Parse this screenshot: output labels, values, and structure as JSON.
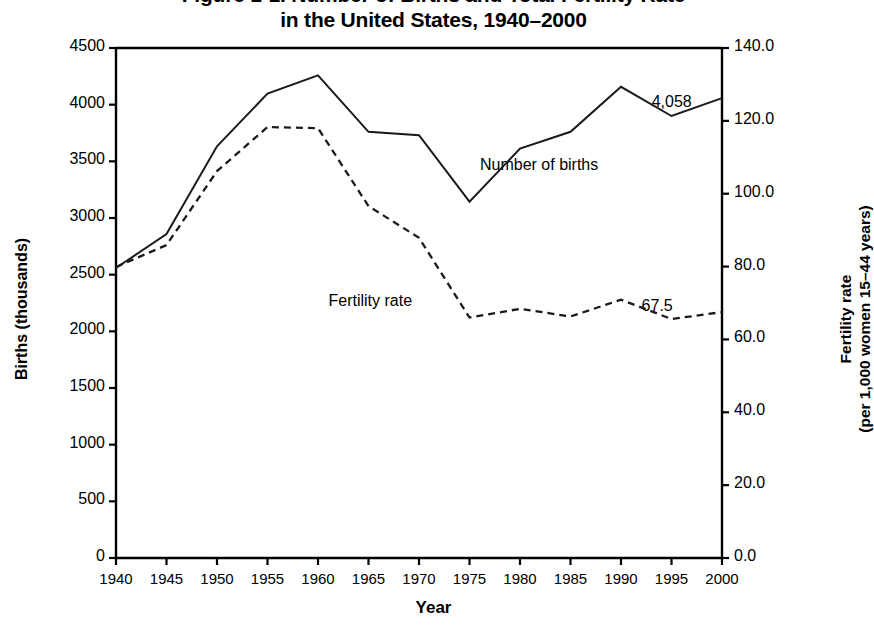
{
  "chart_data": {
    "type": "line",
    "title": "Figure 1-1. Number of Births and Total Fertility Rate in the United States, 1940–2000",
    "title_lines": [
      "Figure 1-1. Number of Births and Total Fertility Rate",
      "in the United States, 1940–2000"
    ],
    "xlabel": "Year",
    "ylabel": "Births (thousands)",
    "ylabel_right_lines": [
      "Fertility rate",
      "(per 1,000 women 15–44 years)"
    ],
    "ylabel_right": "Fertility rate (per 1,000 women 15–44 years)",
    "x": [
      1940,
      1945,
      1950,
      1955,
      1960,
      1965,
      1970,
      1975,
      1980,
      1985,
      1990,
      1995,
      2000
    ],
    "xtick_labels": [
      "1940",
      "1945",
      "1950",
      "1955",
      "1960",
      "1965",
      "1970",
      "1975",
      "1980",
      "1985",
      "1990",
      "1995",
      "2000"
    ],
    "xlim": [
      1940,
      2000
    ],
    "ylim": [
      0,
      4500
    ],
    "ytick_labels": [
      "0",
      "500",
      "1000",
      "1500",
      "2000",
      "2500",
      "3000",
      "3500",
      "4000",
      "4500"
    ],
    "yticks": [
      0,
      500,
      1000,
      1500,
      2000,
      2500,
      3000,
      3500,
      4000,
      4500
    ],
    "ylim_right": [
      0,
      140
    ],
    "ytick_labels_right": [
      "0.0",
      "20.0",
      "40.0",
      "60.0",
      "80.0",
      "100.0",
      "120.0",
      "140.0"
    ],
    "yticks_right": [
      0,
      20,
      40,
      60,
      80,
      100,
      120,
      140
    ],
    "grid": false,
    "legend_position": "inline-annotations",
    "series": [
      {
        "name": "Number of births",
        "axis": "left",
        "style": "solid",
        "color": "#1a1a1a",
        "values": [
          2559,
          2858,
          3632,
          4097,
          4258,
          3760,
          3731,
          3144,
          3612,
          3761,
          4158,
          3900,
          4058
        ]
      },
      {
        "name": "Fertility rate",
        "axis": "right",
        "style": "dashed",
        "color": "#1a1a1a",
        "values": [
          79.9,
          85.9,
          106.2,
          118.3,
          118.0,
          96.6,
          87.9,
          66.0,
          68.4,
          66.3,
          70.9,
          65.6,
          67.5
        ]
      }
    ],
    "annotations": [
      {
        "text": "Number of births",
        "x": 1980,
        "y": 3450,
        "name": "births-series-label"
      },
      {
        "text": "Fertility rate",
        "x": 1965,
        "y": 2250,
        "name": "fertility-series-label"
      },
      {
        "text": "4,058",
        "x": 1997,
        "y": 4010,
        "name": "births-end-value-label"
      },
      {
        "text": "67.5",
        "x": 1996,
        "y": 2210,
        "name": "fertility-end-value-label"
      }
    ]
  }
}
